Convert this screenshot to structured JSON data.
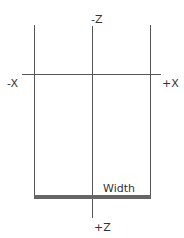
{
  "diagram": {
    "labels": {
      "neg_z": "-Z",
      "pos_z": "+Z",
      "neg_x": "-X",
      "pos_x": "+X",
      "width": "Width"
    },
    "colors": {
      "line": "#555555",
      "bar": "#666666",
      "text": "#333333",
      "background": "#ffffff"
    }
  }
}
